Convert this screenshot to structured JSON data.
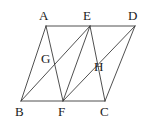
{
  "figure": {
    "type": "geometry-diagram",
    "width": 146,
    "height": 127,
    "background_color": "#ffffff",
    "stroke_color": "#3c3c3c",
    "stroke_width": 0.9,
    "label_color": "#1a1a1a",
    "label_font_size": 13,
    "points": {
      "A": {
        "name": "A",
        "x": 46,
        "y": 26,
        "label_x": 39,
        "label_y": 9
      },
      "B": {
        "name": "B",
        "x": 21,
        "y": 101,
        "label_x": 15,
        "label_y": 105
      },
      "C": {
        "name": "C",
        "x": 105,
        "y": 101,
        "label_x": 100,
        "label_y": 105
      },
      "D": {
        "name": "D",
        "x": 135,
        "y": 26,
        "label_x": 128,
        "label_y": 9
      },
      "E": {
        "name": "E",
        "x": 90,
        "y": 26,
        "label_x": 83,
        "label_y": 9
      },
      "F": {
        "name": "F",
        "x": 63,
        "y": 101,
        "label_x": 58,
        "label_y": 105
      },
      "G": {
        "name": "G",
        "x": 52,
        "y": 63,
        "label_x": 41,
        "label_y": 52
      },
      "H": {
        "name": "H",
        "x": 100,
        "y": 70,
        "label_x": 94,
        "label_y": 60
      }
    },
    "segments": [
      {
        "name": "segment-AD",
        "from": "A",
        "to": "D"
      },
      {
        "name": "segment-BC",
        "from": "B",
        "to": "C"
      },
      {
        "name": "segment-AB",
        "from": "A",
        "to": "B"
      },
      {
        "name": "segment-DC",
        "from": "D",
        "to": "C"
      },
      {
        "name": "segment-AF",
        "from": "A",
        "to": "F"
      },
      {
        "name": "segment-EB",
        "from": "E",
        "to": "B"
      },
      {
        "name": "segment-EF",
        "from": "E",
        "to": "F"
      },
      {
        "name": "segment-EC",
        "from": "E",
        "to": "C"
      },
      {
        "name": "segment-DF",
        "from": "D",
        "to": "F"
      }
    ],
    "vertex_labels": [
      "A",
      "E",
      "D",
      "G",
      "H",
      "B",
      "F",
      "C"
    ]
  }
}
